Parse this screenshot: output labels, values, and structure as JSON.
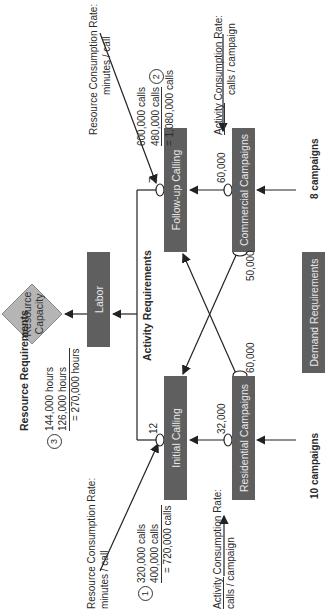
{
  "diagram": {
    "title_resource": "Resource Requirements",
    "title_activity": "Activity Requirements",
    "nodes": {
      "resource_capacity": "Resource Capacity",
      "labor": "Labor",
      "initial_calling": "Initial Calling",
      "followup_calling": "Follow-up Calling",
      "residential_campaigns": "Residential Campaigns",
      "commercial_campaigns": "Commercial Campaigns",
      "demand_requirements": "Demand Requirements"
    },
    "rates": {
      "initial_minutes": "12",
      "followup_minutes": "7",
      "residential_to_initial": "32,000",
      "residential_to_followup": "60,000",
      "commercial_to_followup": "60,000",
      "commercial_to_initial": "50,000"
    },
    "demand": {
      "residential": "10 campaigns",
      "commercial": "8 campaigns"
    },
    "annotations": {
      "rcr_label": "Resource Consumption Rate:",
      "rcr_unit": "minutes / call",
      "acr_label_a": "Activity",
      "acr_label_b": " Consumption Rate:",
      "acr_unit": "calls / campaign"
    },
    "calc1": {
      "marker": "1",
      "line1": "320,000 calls",
      "line2": "400,000 calls",
      "total": "= 720,000 calls"
    },
    "calc2": {
      "marker": "2",
      "line1": "600,000 calls",
      "line2": "480,000 calls",
      "total": "= 1,080,000 calls"
    },
    "calc3": {
      "marker": "3",
      "line1": "144,000 hours",
      "line2": "126,000 hours",
      "total": "= 270,000 hours"
    },
    "colors": {
      "box": "#5f5f5f",
      "diamond": "#b5b5b5",
      "line": "#222222"
    }
  }
}
